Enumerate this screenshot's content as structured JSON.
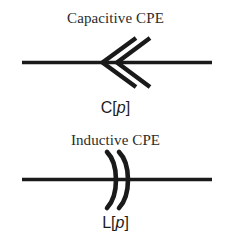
{
  "figure": {
    "background_color": "#ffffff",
    "stroke_color": "#1a1a1a",
    "text_color": "#2b2b2b",
    "width": 231,
    "height": 245
  },
  "elements": [
    {
      "id": "capacitive-cpe",
      "title": "Capacitive CPE",
      "symbol": "double-chevron-left",
      "symbol_description": "two nested chevrons pointing left on a horizontal wire",
      "label_prefix": "C[",
      "label_param": "p",
      "label_suffix": "]",
      "label_full": "C[p]"
    },
    {
      "id": "inductive-cpe",
      "title": "Inductive CPE",
      "symbol": "double-arc-right",
      "symbol_description": "two nested arcs bulging right on a horizontal wire",
      "label_prefix": "L[",
      "label_param": "p",
      "label_suffix": "]",
      "label_full": "L[p]"
    }
  ]
}
